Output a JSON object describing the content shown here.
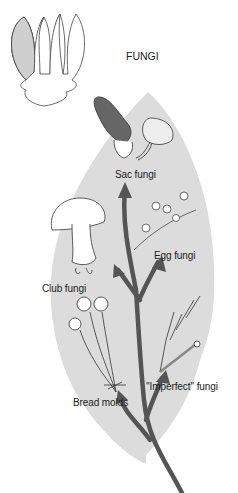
{
  "title": "FUNGI",
  "colors": {
    "background": "#ffffff",
    "leaf_fill": "#dcdcdc",
    "arrow": "#555555",
    "outline": "#444444",
    "icon_fill": "#cfcfcf"
  },
  "groups": [
    {
      "id": "sac",
      "label": "Sac fungi"
    },
    {
      "id": "egg",
      "label": "Egg fungi"
    },
    {
      "id": "club",
      "label": "Club fungi"
    },
    {
      "id": "imperfect",
      "label": "''Imperfect'' fungi"
    },
    {
      "id": "bread",
      "label": "Bread molds"
    }
  ]
}
